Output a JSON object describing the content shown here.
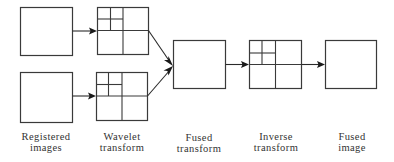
{
  "diagram": {
    "nodes": [
      {
        "id": "registered-image-1",
        "kind": "image",
        "group": "Registered images"
      },
      {
        "id": "registered-image-2",
        "kind": "image",
        "group": "Registered images"
      },
      {
        "id": "wavelet-transform-1",
        "kind": "wavelet-decomposition",
        "group": "Wavelet transform"
      },
      {
        "id": "wavelet-transform-2",
        "kind": "wavelet-decomposition",
        "group": "Wavelet transform"
      },
      {
        "id": "fused-transform",
        "kind": "image",
        "group": "Fused transform"
      },
      {
        "id": "inverse-transform",
        "kind": "wavelet-decomposition",
        "group": "Inverse transform"
      },
      {
        "id": "fused-image",
        "kind": "image",
        "group": "Fused image"
      }
    ],
    "edges": [
      {
        "from": "registered-image-1",
        "to": "wavelet-transform-1"
      },
      {
        "from": "registered-image-2",
        "to": "wavelet-transform-2"
      },
      {
        "from": "wavelet-transform-1",
        "to": "fused-transform"
      },
      {
        "from": "wavelet-transform-2",
        "to": "fused-transform"
      },
      {
        "from": "fused-transform",
        "to": "inverse-transform"
      },
      {
        "from": "inverse-transform",
        "to": "fused-image"
      }
    ],
    "labels": [
      {
        "line1": "Registered",
        "line2": "images"
      },
      {
        "line1": "Wavelet",
        "line2": "transform"
      },
      {
        "line1": "Fused",
        "line2": "transform"
      },
      {
        "line1": "Inverse",
        "line2": "transform"
      },
      {
        "line1": "Fused",
        "line2": "image"
      }
    ]
  }
}
